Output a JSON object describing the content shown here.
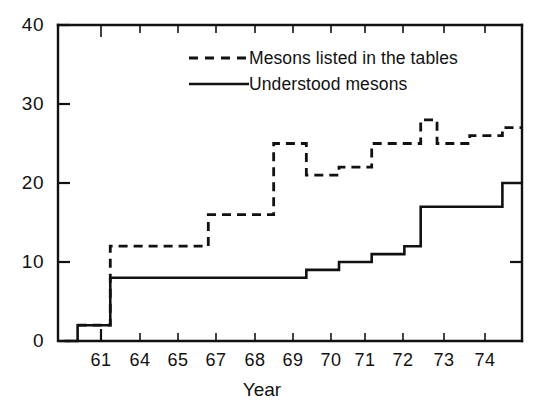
{
  "chart_data": {
    "type": "line",
    "title": "",
    "xlabel": "Year",
    "ylabel": "",
    "xlim": [
      60.4,
      74.6
    ],
    "ylim": [
      0,
      40
    ],
    "grid": false,
    "legend_position": "top-center",
    "x_tick_labels": [
      "61",
      "64",
      "65",
      "67",
      "68",
      "69",
      "70",
      "71",
      "72",
      "73",
      "74"
    ],
    "x_tick_values": [
      61,
      64,
      65,
      67,
      68,
      69,
      70,
      71,
      72,
      73,
      74
    ],
    "y_tick_labels": [
      "0",
      "10",
      "20",
      "30",
      "40"
    ],
    "y_tick_values": [
      0,
      10,
      20,
      30,
      40
    ],
    "step_style": "post",
    "series": [
      {
        "name": "Mesons listed in the tables",
        "style": "dashed",
        "color": "#111111",
        "x": [
          61,
          62,
          64,
          65,
          66,
          67,
          68,
          69,
          70,
          71,
          71.5,
          72,
          73,
          74,
          74.6
        ],
        "values": [
          2,
          12,
          12,
          16,
          16,
          25,
          21,
          22,
          25,
          25,
          28,
          25,
          26,
          27,
          27
        ]
      },
      {
        "name": "Understood mesons",
        "style": "solid",
        "color": "#111111",
        "x": [
          60.6,
          61,
          62,
          64,
          65,
          66,
          67,
          68,
          69,
          70,
          71,
          71.5,
          72,
          73,
          74,
          74.6
        ],
        "values": [
          0,
          2,
          8,
          8,
          8,
          8,
          8,
          9,
          10,
          11,
          12,
          17,
          17,
          17,
          20,
          20
        ]
      }
    ],
    "annotations": []
  },
  "legend": {
    "entries": [
      {
        "label": "Mesons listed in the tables",
        "dash": "dashed"
      },
      {
        "label": "Understood mesons",
        "dash": "solid"
      }
    ]
  },
  "axes": {
    "x_title": "Year"
  }
}
